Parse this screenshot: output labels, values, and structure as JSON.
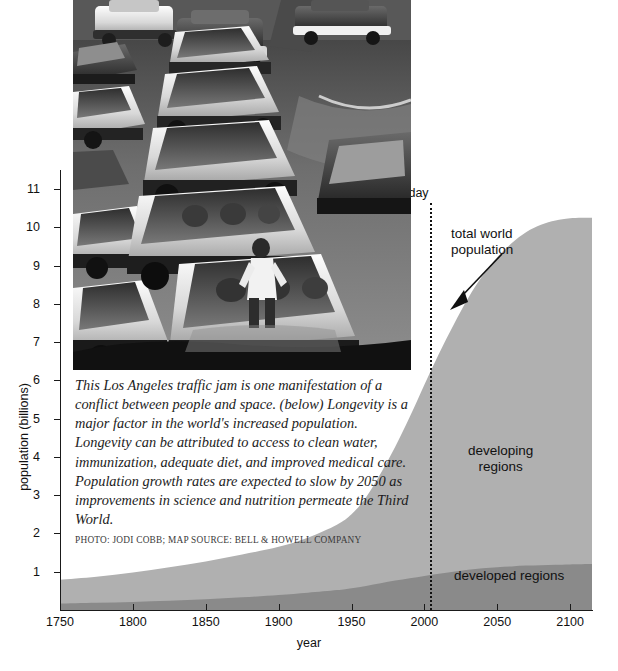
{
  "figure": {
    "photo": {
      "alt_description": "Los Angeles freeway traffic jam, black and white photograph",
      "credit": "PHOTO: JODI COBB; MAP SOURCE: BELL & HOWELL COMPANY"
    },
    "caption": "This Los Angeles traffic jam is one manifestation of a conflict between people and space. (below) Longevity is a major factor in the world's increased population. Longevity can be attributed to access to clean water, immunization, adequate diet, and improved medical care. Population growth rates are expected to slow by 2050 as improvements in science and nutrition permeate the Third World."
  },
  "colors": {
    "developing": "#b0b0b0",
    "developed": "#8a8a8a",
    "axis": "#1a1a1a",
    "text": "#111111",
    "background": "#ffffff"
  },
  "chart_data": {
    "type": "area",
    "stacked": true,
    "title": "",
    "xlabel": "year",
    "ylabel": "population (billions)",
    "xlim": [
      1750,
      2115
    ],
    "ylim": [
      0,
      11.5
    ],
    "grid": false,
    "legend_position": "inline-labels",
    "xticks": [
      1750,
      1800,
      1850,
      1900,
      1950,
      2000,
      2050,
      2100
    ],
    "xtick_labels": [
      "1750",
      "1800",
      "1850",
      "1900",
      "1950",
      "2000",
      "2050",
      "2100"
    ],
    "yticks": [
      1,
      2,
      3,
      4,
      5,
      6,
      7,
      8,
      9,
      10,
      11
    ],
    "ytick_labels": [
      "1",
      "2",
      "3",
      "4",
      "5",
      "6",
      "7",
      "8",
      "9",
      "10",
      "11"
    ],
    "x": [
      1750,
      1775,
      1800,
      1825,
      1850,
      1875,
      1900,
      1920,
      1940,
      1950,
      1960,
      1970,
      1980,
      1990,
      2000,
      2010,
      2020,
      2030,
      2040,
      2050,
      2060,
      2070,
      2080,
      2090,
      2100,
      2115
    ],
    "series": [
      {
        "name": "developed regions",
        "values": [
          0.17,
          0.19,
          0.21,
          0.24,
          0.28,
          0.33,
          0.39,
          0.45,
          0.52,
          0.57,
          0.63,
          0.7,
          0.77,
          0.83,
          0.89,
          0.95,
          1.0,
          1.05,
          1.09,
          1.12,
          1.14,
          1.16,
          1.17,
          1.18,
          1.19,
          1.2
        ],
        "color": "#8a8a8a"
      },
      {
        "name": "developing regions",
        "values": [
          0.62,
          0.68,
          0.77,
          0.88,
          0.99,
          1.12,
          1.26,
          1.44,
          1.71,
          1.93,
          2.32,
          2.87,
          3.5,
          4.22,
          5.0,
          5.75,
          6.45,
          7.1,
          7.65,
          8.1,
          8.45,
          8.72,
          8.9,
          9.0,
          9.05,
          9.05
        ],
        "color": "#b0b0b0"
      }
    ],
    "total_series": {
      "name": "total world population",
      "values": [
        0.79,
        0.87,
        0.98,
        1.12,
        1.27,
        1.45,
        1.65,
        1.89,
        2.23,
        2.5,
        2.95,
        3.57,
        4.27,
        5.05,
        5.89,
        6.7,
        7.45,
        8.15,
        8.74,
        9.22,
        9.59,
        9.88,
        10.07,
        10.18,
        10.24,
        10.25
      ]
    },
    "annotations": [
      {
        "name": "today",
        "label": "today",
        "x": 2010,
        "style": "dotted-vertical-line"
      },
      {
        "name": "total-world-population",
        "label": "total world\npopulation",
        "points_to_x": 2022,
        "points_to_y": 7.6,
        "style": "arrow"
      },
      {
        "name": "developing-regions",
        "label": "developing\nregions",
        "style": "area-label"
      },
      {
        "name": "developed-regions",
        "label": "developed regions",
        "style": "area-label"
      }
    ]
  },
  "labels": {
    "today": "today",
    "total_world_line1": "total world",
    "total_world_line2": "population",
    "developing_line1": "developing",
    "developing_line2": "regions",
    "developed": "developed regions",
    "x_axis_title": "year",
    "y_axis_title": "population (billions)"
  }
}
